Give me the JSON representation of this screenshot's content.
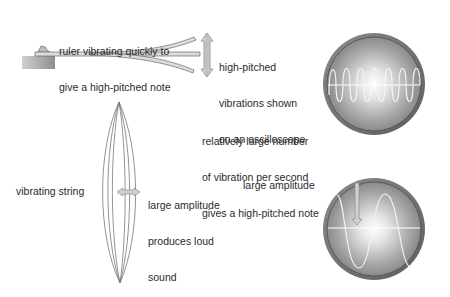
{
  "ruler": {
    "caption_line1": "ruler vibrating quickly to",
    "caption_line2": "give a high-pitched note"
  },
  "high_pitch": {
    "caption_line1": "high-pitched",
    "caption_line2": "vibrations shown",
    "caption_line3": "on an oscilloscope"
  },
  "frequency_note": {
    "line1": "relatively large number",
    "line2": "of vibration per second",
    "line3": "gives a high-pitched note"
  },
  "string": {
    "label": "vibrating string"
  },
  "loud": {
    "line1": "large amplitude",
    "line2": "produces loud",
    "line3": "sound"
  },
  "amplitude": {
    "label": "large amplitude"
  },
  "oscilloscopes": [
    {
      "name": "high-frequency",
      "cycles": 6.5,
      "amplitude_px": 22
    },
    {
      "name": "large-amplitude",
      "cycles": 1.3,
      "amplitude_px": 38
    }
  ],
  "colors": {
    "bezel": "#6e6e6e",
    "screen_edge": "#8a8a8a",
    "screen_center": "#ffffff",
    "arrow_fill": "#cfcfcf",
    "arrow_stroke": "#8c8c8c",
    "ruler_fill": "#d8d8d8",
    "clamp_block": "#9a9a9a"
  }
}
